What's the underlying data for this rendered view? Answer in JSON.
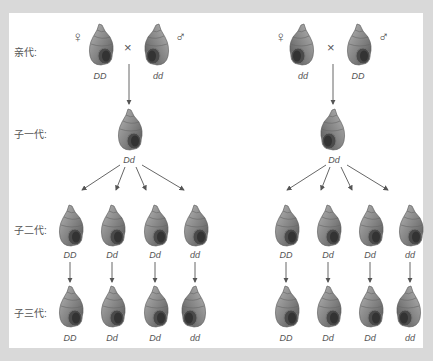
{
  "generation_labels": {
    "parents": "亲代:",
    "f1": "子一代:",
    "f2": "子二代:",
    "f3": "子三代:"
  },
  "symbols": {
    "female": "♀",
    "male": "♂",
    "cross": "×"
  },
  "left_cross": {
    "female_genotype": "DD",
    "male_genotype": "dd",
    "f1_genotype": "Dd",
    "f2_genotypes": [
      "DD",
      "Dd",
      "Dd",
      "dd"
    ],
    "f3_genotypes": [
      "DD",
      "Dd",
      "Dd",
      "dd"
    ],
    "coiling": {
      "female": "dextral",
      "male": "sinistral",
      "f1": "dextral",
      "f2": [
        "dextral",
        "dextral",
        "dextral",
        "dextral"
      ],
      "f3": [
        "dextral",
        "dextral",
        "dextral",
        "sinistral"
      ]
    }
  },
  "right_cross": {
    "female_genotype": "dd",
    "male_genotype": "DD",
    "f1_genotype": "Dd",
    "f2_genotypes": [
      "DD",
      "Dd",
      "Dd",
      "dd"
    ],
    "f3_genotypes": [
      "DD",
      "Dd",
      "Dd",
      "dd"
    ],
    "coiling": {
      "female": "sinistral",
      "male": "dextral",
      "f1": "sinistral",
      "f2": [
        "dextral",
        "dextral",
        "dextral",
        "dextral"
      ],
      "f3": [
        "dextral",
        "dextral",
        "dextral",
        "sinistral"
      ]
    }
  },
  "colors": {
    "panel": "#ffffff",
    "frame": "#d9d9d9",
    "text": "#555555",
    "arrow": "#555555",
    "shell": "#8a8a8a"
  }
}
